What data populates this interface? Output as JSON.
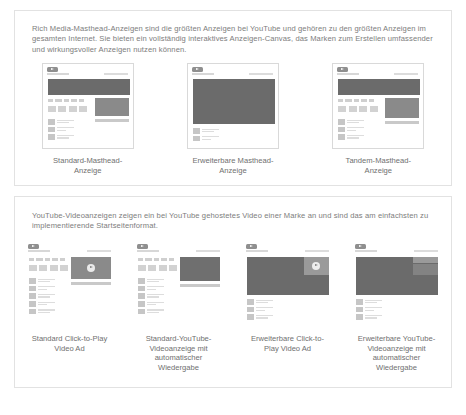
{
  "masthead_section": {
    "intro": "Rich Media-Masthead-Anzeigen sind die größten Anzeigen bei YouTube und gehören zu den größten Anzeigen im gesamten Internet. Sie bieten ein vollständig interaktives Anzeigen-Canvas, das Marken zum Erstellen umfassender und wirkungsvoller Anzeigen nutzen können.",
    "items": [
      {
        "caption": "Standard-Masthead-Anzeige",
        "layout": "standard-masthead"
      },
      {
        "caption": "Erweiterbare Masthead-Anzeige",
        "layout": "expandable-masthead"
      },
      {
        "caption": "Tandem-Masthead-Anzeige",
        "layout": "tandem-masthead"
      }
    ]
  },
  "video_section": {
    "intro": "YouTube-Videoanzeigen zeigen ein bei YouTube gehostetes Video einer Marke an und sind das am einfachsten zu implementierende Startseitenformat.",
    "items": [
      {
        "caption": "Standard Click-to-Play Video Ad",
        "layout": "standard-click-to-play"
      },
      {
        "caption": "Standard-YouTube-Videoanzeige mit automatischer Wiedergabe",
        "layout": "standard-autoplay"
      },
      {
        "caption": "Erweiterbare Click-to-Play Video Ad",
        "layout": "expandable-click-to-play"
      },
      {
        "caption": "Erweiterbare YouTube-Videoanzeige mit automatischer Wiedergabe",
        "layout": "expandable-autoplay"
      }
    ]
  },
  "colors": {
    "card_border": "#e2e2e2",
    "text": "#6f6f6f",
    "banner_dark": "#6b6b6b",
    "banner_light": "#9a9a9a",
    "background": "#ffffff"
  },
  "footnote": ""
}
